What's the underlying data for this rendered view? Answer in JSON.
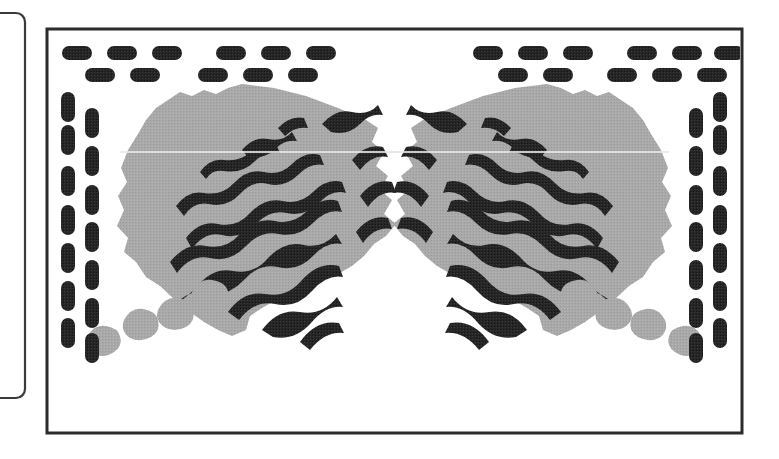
{
  "page": {
    "background_color": "#ffffff",
    "width": 779,
    "height": 459
  },
  "colors": {
    "ink": "#1a1a1a",
    "frame_stroke": "#2b2b2b",
    "gray_fill": "#a9a9a9",
    "paper": "#ffffff",
    "clipped_box_stroke": "#3a3a3a",
    "highlight_line": "#e8e8e8"
  },
  "clipped_box": {
    "name": "partial-rounded-rectangle-left",
    "x": -40,
    "y": 13,
    "width": 65,
    "height": 385,
    "corner_radius": 9,
    "stroke_width": 2
  },
  "main_frame": {
    "name": "figure-outer-frame",
    "x": 47,
    "y": 29,
    "width": 695,
    "height": 404,
    "stroke_width": 3
  },
  "dash_border": {
    "pill_width": 30,
    "pill_height": 14,
    "pill_radius": 7,
    "vertical_pill_width": 14,
    "vertical_pill_height": 30,
    "top_row_outer_y": 46,
    "top_row_inner_y": 68,
    "left_col_outer_x": 61,
    "left_col_inner_x": 85,
    "right_col_outer_x": 713,
    "right_col_inner_x": 689,
    "top_outer_count": 12,
    "top_inner_count": 10,
    "side_outer_count": 7,
    "side_inner_count": 7
  },
  "top_dashes_outer_x": [
    62,
    107,
    152,
    216,
    261,
    306,
    473,
    518,
    563,
    627,
    672,
    714
  ],
  "top_dashes_inner_x": [
    85,
    130,
    198,
    243,
    288,
    498,
    543,
    607,
    652,
    697
  ],
  "left_dashes_outer_y": [
    92,
    125,
    166,
    205,
    243,
    281,
    318
  ],
  "left_dashes_inner_y": [
    108,
    146,
    185,
    222,
    260,
    298,
    333
  ],
  "right_dashes_outer_y": [
    92,
    125,
    166,
    205,
    243,
    281,
    318
  ],
  "right_dashes_inner_y": [
    108,
    146,
    185,
    222,
    260,
    298,
    333
  ],
  "left_cluster": {
    "name": "left-striped-mass",
    "gray_mass_label": "irregular gray region",
    "stripe_count": 12,
    "stripe_angle_deg": -28,
    "small_blob_count": 4,
    "small_blob_positions": [
      [
        96,
        336
      ],
      [
        134,
        322
      ],
      [
        167,
        312
      ],
      [
        199,
        296
      ]
    ]
  },
  "right_cluster": {
    "name": "right-striped-mass",
    "gray_mass_label": "irregular gray region (mirrored)",
    "stripe_count": 12,
    "stripe_angle_deg": 28,
    "small_blob_count": 4,
    "small_blob_positions": [
      [
        693,
        336
      ],
      [
        655,
        322
      ],
      [
        622,
        312
      ],
      [
        590,
        296
      ]
    ]
  },
  "scan_artifacts": {
    "horizontal_highlight_y": 152,
    "note": "faint horizontal light streak across both masses"
  }
}
